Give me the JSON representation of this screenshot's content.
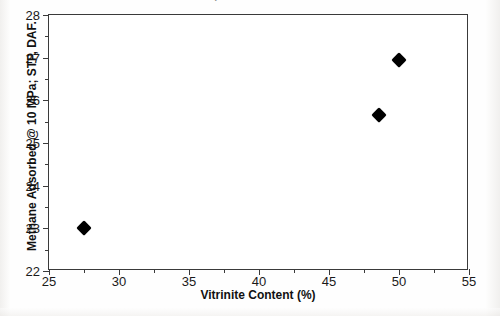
{
  "figure": {
    "top_caption_fragment": "samples",
    "background_color": "#fefefe",
    "frame_color": "#3a3a3a",
    "marker_color": "#000000"
  },
  "chart_data": {
    "type": "scatter",
    "title": "",
    "xlabel": "Vitrinite Content (%)",
    "ylabel": "Methane Adsorbed @ 10 MPa; STP, DAF.",
    "xlim": [
      25,
      55
    ],
    "ylim": [
      22,
      28
    ],
    "xticks": [
      25,
      30,
      35,
      40,
      45,
      50,
      55
    ],
    "xtick_labels": [
      "25",
      "30",
      "35",
      "40",
      "45",
      "50",
      "55"
    ],
    "xminor_ticks": [
      27.5,
      32.5,
      37.5,
      42.5,
      47.5,
      52.5
    ],
    "yticks": [
      22,
      23,
      24,
      25,
      26,
      27,
      28
    ],
    "ytick_labels": [
      "22",
      "23",
      "24",
      "25",
      "26",
      "27",
      "28"
    ],
    "yminor_ticks": [
      22.5,
      23.5,
      24.5,
      25.5,
      26.5,
      27.5
    ],
    "grid": false,
    "legend": false,
    "marker": "diamond",
    "series": [
      {
        "name": "Methane adsorption vs vitrinite",
        "points": [
          {
            "x": 27.5,
            "y": 23.0
          },
          {
            "x": 48.6,
            "y": 25.65
          },
          {
            "x": 50.0,
            "y": 26.95
          }
        ]
      }
    ]
  }
}
